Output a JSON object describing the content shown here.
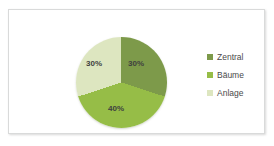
{
  "chart_data": {
    "type": "pie",
    "title": "",
    "categories": [
      "Zentral",
      "Bäume",
      "Anlage"
    ],
    "values": [
      30,
      40,
      30
    ],
    "data_labels": [
      "30%",
      "40%",
      "30%"
    ],
    "unit": "%",
    "legend_position": "right",
    "grid": false,
    "colors": [
      "#7d9a4a",
      "#96bd47",
      "#dde6c0"
    ],
    "start_angle_deg": 0,
    "series": [
      {
        "name": "Verteilung",
        "values": [
          30,
          40,
          30
        ]
      }
    ]
  },
  "legend": {
    "items": [
      {
        "label": "Zentral",
        "swatch_color": "#7d9a4a",
        "value": "30%"
      },
      {
        "label": "Bäume",
        "swatch_color": "#96bd47",
        "value": "40%"
      },
      {
        "label": "Anlage",
        "swatch_color": "#dde6c0",
        "value": "30%"
      }
    ]
  },
  "frame": {
    "border_color": "#d9dada",
    "background": "#ffffff"
  }
}
